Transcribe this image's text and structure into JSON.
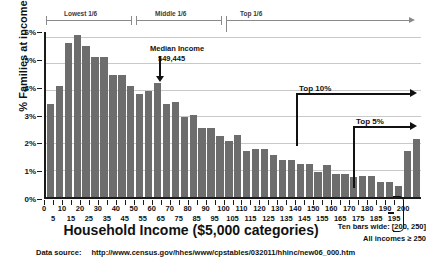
{
  "chart_data": {
    "type": "bar",
    "title": "",
    "xlabel": "Household Income ($5,000 categories)",
    "ylabel": "% Families at income",
    "ylim": [
      0,
      6.3
    ],
    "ytick_labels": [
      "0%",
      "1%",
      "2%",
      "3%",
      "4%",
      "5%",
      "6%"
    ],
    "ytick_values": [
      0,
      1,
      2,
      3,
      4,
      5,
      6
    ],
    "grid": true,
    "legend": "none",
    "xtick_labels_upper": [
      "0",
      "10",
      "20",
      "30",
      "40",
      "50",
      "60",
      "70",
      "80",
      "90",
      "100",
      "110",
      "120",
      "130",
      "140",
      "150",
      "160",
      "170",
      "180",
      "190",
      "200"
    ],
    "xtick_labels_lower": [
      "5",
      "15",
      "25",
      "35",
      "45",
      "55",
      "65",
      "75",
      "85",
      "95",
      "105",
      "115",
      "125",
      "135",
      "145",
      "155",
      "165",
      "175",
      "185",
      "195"
    ],
    "categories": [
      "0-5",
      "5-10",
      "10-15",
      "15-20",
      "20-25",
      "25-30",
      "30-35",
      "35-40",
      "40-45",
      "45-50",
      "50-55",
      "55-60",
      "60-65",
      "65-70",
      "70-75",
      "75-80",
      "80-85",
      "85-90",
      "90-95",
      "95-100",
      "100-105",
      "105-110",
      "110-115",
      "115-120",
      "120-125",
      "125-130",
      "130-135",
      "135-140",
      "140-145",
      "145-150",
      "150-155",
      "155-160",
      "160-165",
      "165-170",
      "170-175",
      "175-180",
      "180-185",
      "185-190",
      "190-195",
      "195-200",
      "200-250",
      "250+"
    ],
    "values": [
      3.5,
      4.2,
      5.8,
      6.1,
      5.7,
      5.3,
      5.3,
      4.6,
      4.6,
      4.2,
      3.9,
      4.0,
      4.3,
      3.5,
      3.6,
      3.0,
      3.1,
      2.6,
      2.6,
      2.3,
      2.1,
      2.35,
      1.75,
      1.8,
      1.8,
      1.6,
      1.4,
      1.4,
      1.25,
      1.25,
      0.95,
      1.2,
      0.85,
      0.85,
      0.75,
      0.8,
      0.8,
      0.55,
      0.55,
      0.4,
      1.75,
      2.2
    ],
    "annotations": [
      {
        "name": "segment-lowest",
        "label": "Lowest 1/6"
      },
      {
        "name": "segment-middle",
        "label": "Middle 1/6"
      },
      {
        "name": "segment-top",
        "label": "Top 1/6"
      },
      {
        "name": "median",
        "label_line1": "Median Income",
        "label_line2": "$49,445"
      },
      {
        "name": "top-10",
        "label": "Top 10%"
      },
      {
        "name": "top-5",
        "label": "Top 5%"
      }
    ],
    "notes": {
      "ten_bars_wide": "Ten bars wide: [200, 250]",
      "all_incomes": "All incomes ≥ 250"
    },
    "data_source_label": "Data source:",
    "data_source_url": "http://www.census.gov/hhes/www/cpstables/032011/hhinc/new06_000.htm",
    "colors": {
      "bar": "#6d6d6d",
      "axis": "#1a1a1a",
      "grid": "#c9c9c9",
      "annotation": "#111111"
    }
  }
}
